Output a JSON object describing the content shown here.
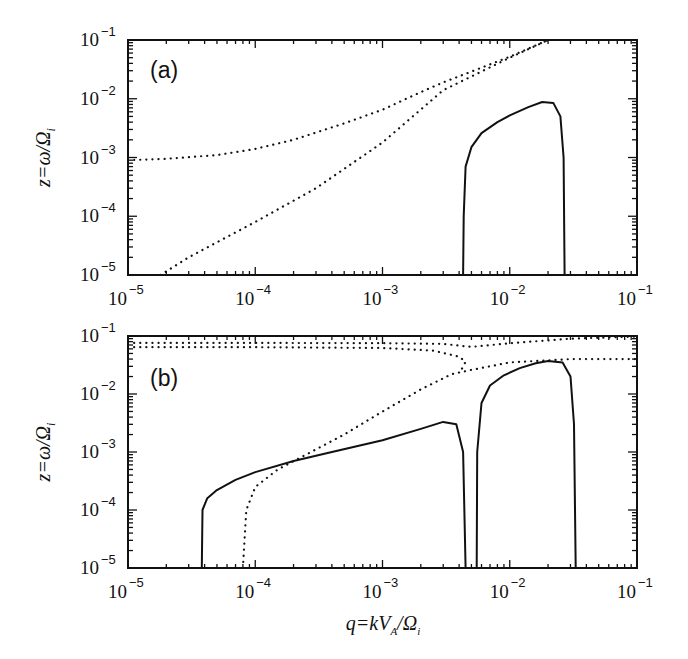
{
  "chart_data": [
    {
      "type": "line",
      "panel_label": "(a)",
      "title": "",
      "xlabel": "q=kV_A/Ω_i",
      "ylabel": "z=ω/Ω_i",
      "xscale": "log",
      "yscale": "log",
      "xlim": [
        1e-05,
        0.1
      ],
      "ylim": [
        1e-05,
        0.1
      ],
      "x_tick_labels": [
        "10^-5",
        "10^-4",
        "10^-3",
        "10^-2",
        "10^-1"
      ],
      "y_tick_labels": [
        "10^-5",
        "10^-4",
        "10^-3",
        "10^-2",
        "10^-1"
      ],
      "grid": false,
      "legend": null,
      "series": [
        {
          "name": "dotted-upper-branch",
          "style": "dotted",
          "x": [
            1e-05,
            2e-05,
            5e-05,
            0.0001,
            0.0002,
            0.0005,
            0.001,
            0.002,
            0.003,
            0.005,
            0.01,
            0.02
          ],
          "y": [
            0.0009,
            0.00095,
            0.0011,
            0.0014,
            0.002,
            0.0038,
            0.0065,
            0.013,
            0.019,
            0.029,
            0.052,
            0.1
          ]
        },
        {
          "name": "dotted-lower-branch",
          "style": "dotted",
          "x": [
            1.8e-05,
            3e-05,
            0.0001,
            0.0003,
            0.001,
            0.003,
            0.01,
            0.02
          ],
          "y": [
            1e-05,
            2e-05,
            8e-05,
            0.0003,
            0.0018,
            0.014,
            0.05,
            0.1
          ]
        },
        {
          "name": "growth-rate-lobe",
          "style": "solid",
          "x": [
            0.0043,
            0.00435,
            0.0045,
            0.005,
            0.006,
            0.008,
            0.01,
            0.014,
            0.018,
            0.022,
            0.025,
            0.0265,
            0.027
          ],
          "y": [
            1e-05,
            0.0001,
            0.0007,
            0.0015,
            0.0026,
            0.004,
            0.0052,
            0.0072,
            0.0088,
            0.0085,
            0.005,
            0.001,
            1e-05
          ]
        }
      ]
    },
    {
      "type": "line",
      "panel_label": "(b)",
      "title": "",
      "xlabel": "q=kV_A/Ω_i",
      "ylabel": "z=ω/Ω_i",
      "xscale": "log",
      "yscale": "log",
      "xlim": [
        1e-05,
        0.1
      ],
      "ylim": [
        1e-05,
        0.1
      ],
      "x_tick_labels": [
        "10^-5",
        "10^-4",
        "10^-3",
        "10^-2",
        "10^-1"
      ],
      "y_tick_labels": [
        "10^-5",
        "10^-4",
        "10^-3",
        "10^-2",
        "10^-1"
      ],
      "grid": false,
      "legend": null,
      "series": [
        {
          "name": "dotted-top-branch",
          "style": "dotted",
          "x": [
            1e-05,
            0.0001,
            0.001,
            0.003,
            0.005,
            0.01,
            0.03,
            0.1
          ],
          "y": [
            0.076,
            0.076,
            0.075,
            0.073,
            0.065,
            0.075,
            0.09,
            0.098
          ]
        },
        {
          "name": "dotted-second-branch",
          "style": "dotted",
          "x": [
            1e-05,
            0.0001,
            0.001,
            0.0025,
            0.004,
            0.0045,
            0.0042
          ],
          "y": [
            0.064,
            0.064,
            0.062,
            0.056,
            0.044,
            0.036,
            0.027
          ]
        },
        {
          "name": "dotted-rising-branch",
          "style": "dotted",
          "x": [
            8e-05,
            8.5e-05,
            0.0001,
            0.00015,
            0.00025,
            0.0005,
            0.001,
            0.002,
            0.0035,
            0.005,
            0.01,
            0.03,
            0.1
          ],
          "y": [
            1e-05,
            0.0001,
            0.00025,
            0.0005,
            0.0009,
            0.002,
            0.005,
            0.012,
            0.022,
            0.026,
            0.035,
            0.04,
            0.04
          ]
        },
        {
          "name": "growth-rate-lobe-1",
          "style": "solid",
          "x": [
            3.8e-05,
            3.85e-05,
            4.2e-05,
            5e-05,
            7e-05,
            0.0001,
            0.0002,
            0.0004,
            0.001,
            0.002,
            0.003,
            0.0038,
            0.0043,
            0.0045
          ],
          "y": [
            1e-05,
            0.0001,
            0.00016,
            0.00022,
            0.00033,
            0.00045,
            0.0007,
            0.001,
            0.0016,
            0.0025,
            0.0033,
            0.003,
            0.001,
            1e-05
          ]
        },
        {
          "name": "growth-rate-lobe-2",
          "style": "solid",
          "x": [
            0.0055,
            0.00555,
            0.006,
            0.007,
            0.009,
            0.012,
            0.016,
            0.02,
            0.026,
            0.03,
            0.032,
            0.033
          ],
          "y": [
            1e-05,
            0.001,
            0.007,
            0.014,
            0.021,
            0.028,
            0.034,
            0.037,
            0.035,
            0.02,
            0.003,
            1e-05
          ]
        }
      ]
    }
  ],
  "figure": {
    "panels": [
      {
        "label": "(a)",
        "ylabel_main": "z=ω/Ω",
        "ylabel_sub": "i"
      },
      {
        "label": "(b)",
        "ylabel_main": "z=ω/Ω",
        "ylabel_sub": "i"
      }
    ],
    "xlabel_main": "q=kV",
    "xlabel_sub_A": "A",
    "xlabel_mid": "/Ω",
    "xlabel_sub_i": "i",
    "tick_base": "10",
    "x_exponents": [
      "−5",
      "−4",
      "−3",
      "−2",
      "−1"
    ],
    "y_exponents": [
      "−1",
      "−2",
      "−3",
      "−4",
      "−5"
    ]
  }
}
